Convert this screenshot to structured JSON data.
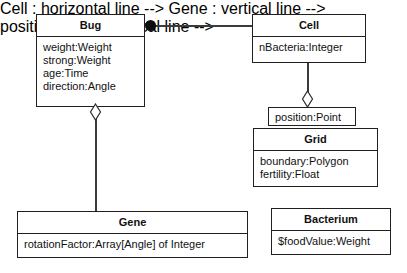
{
  "diagram": {
    "type": "uml-class-diagram",
    "background_color": "#ffffff",
    "line_color": "#3b3b3b",
    "border_color": "#231f20",
    "text_color": "#111111"
  },
  "classes": {
    "bug": {
      "name": "Bug",
      "attributes": [
        "weight:Weight",
        "strong:Weight",
        "age:Time",
        "direction:Angle"
      ]
    },
    "cell": {
      "name": "Cell",
      "attributes": [
        "nBacteria:Integer"
      ]
    },
    "grid": {
      "name": "Grid",
      "attributes": [
        "boundary:Polygon",
        "fertility:Float"
      ]
    },
    "gene": {
      "name": "Gene",
      "attributes": [
        "rotationFactor:Array[Angle] of Integer"
      ]
    },
    "bacterium": {
      "name": "Bacterium",
      "attributes": [
        "$foodValue:Weight"
      ]
    }
  },
  "slots": {
    "position": {
      "label": "position:Point"
    }
  },
  "relationships": [
    {
      "id": "bug-cell",
      "from": "Bug",
      "to": "Cell",
      "kind": "composition",
      "adornment": "filled-ball",
      "adornment_end": "Bug"
    },
    {
      "id": "bug-gene",
      "from": "Bug",
      "to": "Gene",
      "kind": "aggregation",
      "adornment": "hollow-diamond",
      "adornment_end": "Bug"
    },
    {
      "id": "cell-position",
      "from": "Cell",
      "to": "position:Point",
      "kind": "aggregation",
      "adornment": "hollow-diamond",
      "adornment_end": "Cell"
    }
  ]
}
